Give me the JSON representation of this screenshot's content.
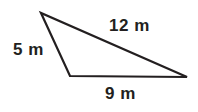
{
  "figure": {
    "type": "triangle-diagram",
    "unit": "m",
    "background_color": "#ffffff",
    "stroke_color": "#231f20",
    "stroke_width": 2,
    "text_color": "#231f20",
    "vertices": {
      "top_left": {
        "x": 41,
        "y": 13
      },
      "bottom_left": {
        "x": 70,
        "y": 76
      },
      "right": {
        "x": 187,
        "y": 77
      }
    },
    "labels": {
      "hypotenuse": "12 m",
      "left_side": "5 m",
      "base": "9 m"
    }
  }
}
